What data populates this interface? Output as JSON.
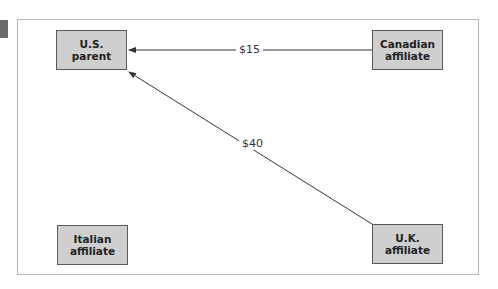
{
  "diagram": {
    "nodes": [
      {
        "id": "us",
        "line1": "U.S.",
        "line2": "parent"
      },
      {
        "id": "canada",
        "line1": "Canadian",
        "line2": "affiliate"
      },
      {
        "id": "italy",
        "line1": "Italian",
        "line2": "affiliate"
      },
      {
        "id": "uk",
        "line1": "U.K.",
        "line2": "affiliate"
      }
    ],
    "edges": [
      {
        "from": "canada",
        "to": "us",
        "label": "$15"
      },
      {
        "from": "uk",
        "to": "us",
        "label": "$40"
      }
    ],
    "colors": {
      "node_fill": "#cfcfcf",
      "node_border": "#5a5a5a",
      "edge": "#333333",
      "frame_border": "#b8b8b8"
    }
  }
}
